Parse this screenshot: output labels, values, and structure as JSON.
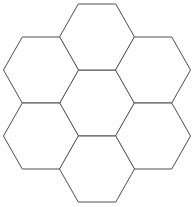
{
  "figure": {
    "shape_name": "hexagon",
    "arrangement": "flower-rosette-7",
    "cell_count": 7,
    "orientation": "flat-top",
    "background_color": "#ffffff",
    "stroke_color": "#4f4f4f",
    "fill_color": "#ffffff",
    "stroke_width": 1
  },
  "chart_data": {
    "type": "diagram",
    "canvas": {
      "width": 196,
      "height": 207
    },
    "geometry": {
      "orientation": "flat-top",
      "circumradius": 37.5,
      "inradius": 33,
      "cell_width": 75,
      "cell_height": 66,
      "bounds": {
        "x_min": 6,
        "x_max": 188,
        "y_min": 4,
        "y_max": 199
      }
    },
    "cells": [
      {
        "name": "center",
        "axial_q": 0,
        "axial_r": 0,
        "cx": 97,
        "cy": 103
      },
      {
        "name": "top",
        "axial_q": 0,
        "axial_r": -1,
        "cx": 97,
        "cy": 37
      },
      {
        "name": "upper-left",
        "axial_q": -1,
        "axial_r": 0,
        "cx": 41,
        "cy": 70
      },
      {
        "name": "upper-right",
        "axial_q": 1,
        "axial_r": -1,
        "cx": 153,
        "cy": 70
      },
      {
        "name": "lower-left",
        "axial_q": -1,
        "axial_r": 1,
        "cx": 41,
        "cy": 136
      },
      {
        "name": "lower-right",
        "axial_q": 1,
        "axial_r": 0,
        "cx": 153,
        "cy": 136
      },
      {
        "name": "bottom",
        "axial_q": 0,
        "axial_r": 1,
        "cx": 97,
        "cy": 169
      }
    ]
  }
}
